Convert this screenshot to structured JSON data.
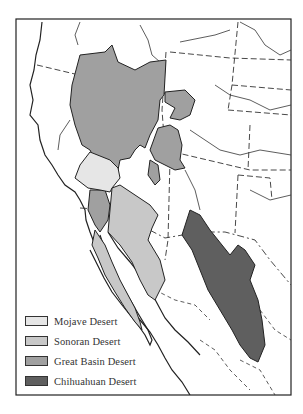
{
  "map": {
    "title": "",
    "region": "Western North America",
    "legend": [
      {
        "label": "Mojave Desert",
        "color": "#e6e6e6"
      },
      {
        "label": "Sonoran Desert",
        "color": "#c8c8c8"
      },
      {
        "label": "Great Basin Desert",
        "color": "#a0a0a0"
      },
      {
        "label": "Chihuahuan Desert",
        "color": "#5f5f5f"
      }
    ],
    "colors": {
      "frame": "#222222",
      "coast": "#222222",
      "border": "#333333",
      "background": "#ffffff"
    }
  }
}
